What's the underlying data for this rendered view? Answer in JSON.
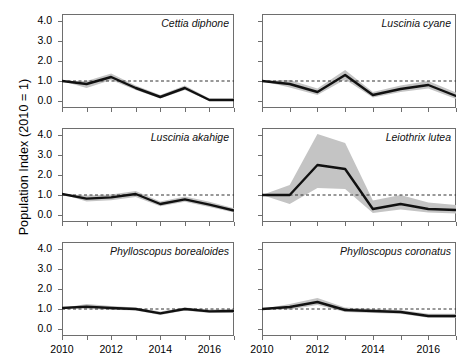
{
  "axes": {
    "ylabel": "Population Index (2010 = 1)",
    "ytick_labels": [
      "4.0",
      "3.0",
      "2.0",
      "1.0",
      "0.0"
    ],
    "ytick_values": [
      4.0,
      3.0,
      2.0,
      1.0,
      0.0
    ],
    "xtick_labels": [
      "2010",
      "2012",
      "2014",
      "2016"
    ],
    "xtick_values": [
      2010,
      2012,
      2014,
      2016
    ],
    "ylim": [
      -0.35,
      4.35
    ],
    "xlim": [
      2010,
      2017
    ],
    "reference_line": 1.0
  },
  "style": {
    "line_color": "#111111",
    "ribbon_color": "#c4c4c4",
    "reference_line_color": "#333333",
    "axis_color": "#6e6e6e",
    "background": "#ffffff"
  },
  "chart_data": [
    {
      "type": "line",
      "title": "Cettia diphone",
      "xlabel": "",
      "ylabel": "Population Index (2010 = 1)",
      "x": [
        2010,
        2011,
        2012,
        2013,
        2014,
        2015,
        2016,
        2017
      ],
      "ylim": [
        -0.35,
        4.35
      ],
      "grid": false,
      "series": [
        {
          "name": "index",
          "values": [
            1.0,
            0.85,
            1.2,
            0.65,
            0.2,
            0.65,
            0.05,
            0.05
          ]
        },
        {
          "name": "ci_lower",
          "values": [
            1.0,
            0.65,
            1.05,
            0.55,
            0.12,
            0.55,
            0.0,
            0.0
          ]
        },
        {
          "name": "ci_upper",
          "values": [
            1.0,
            1.0,
            1.38,
            0.78,
            0.3,
            0.78,
            0.12,
            0.12
          ]
        }
      ]
    },
    {
      "type": "line",
      "title": "Luscinia cyane",
      "xlabel": "",
      "ylabel": "",
      "x": [
        2010,
        2011,
        2012,
        2013,
        2014,
        2015,
        2016,
        2017
      ],
      "ylim": [
        -0.35,
        4.35
      ],
      "grid": false,
      "series": [
        {
          "name": "index",
          "values": [
            1.0,
            0.85,
            0.45,
            1.3,
            0.3,
            0.6,
            0.8,
            0.25
          ]
        },
        {
          "name": "ci_lower",
          "values": [
            1.0,
            0.68,
            0.3,
            1.08,
            0.18,
            0.45,
            0.62,
            0.1
          ]
        },
        {
          "name": "ci_upper",
          "values": [
            1.0,
            1.05,
            0.62,
            1.55,
            0.45,
            0.78,
            1.0,
            0.42
          ]
        }
      ]
    },
    {
      "type": "line",
      "title": "Luscinia akahige",
      "xlabel": "",
      "ylabel": "",
      "x": [
        2010,
        2011,
        2012,
        2013,
        2014,
        2015,
        2016,
        2017
      ],
      "ylim": [
        -0.35,
        4.35
      ],
      "grid": false,
      "series": [
        {
          "name": "index",
          "values": [
            1.05,
            0.82,
            0.88,
            1.05,
            0.55,
            0.78,
            0.52,
            0.22
          ]
        },
        {
          "name": "ci_lower",
          "values": [
            1.05,
            0.68,
            0.74,
            0.9,
            0.44,
            0.66,
            0.4,
            0.12
          ]
        },
        {
          "name": "ci_upper",
          "values": [
            1.05,
            0.97,
            1.03,
            1.2,
            0.68,
            0.92,
            0.66,
            0.34
          ]
        }
      ]
    },
    {
      "type": "line",
      "title": "Leiothrix lutea",
      "xlabel": "",
      "ylabel": "",
      "x": [
        2010,
        2011,
        2012,
        2013,
        2014,
        2015,
        2016,
        2017
      ],
      "ylim": [
        -0.35,
        4.35
      ],
      "grid": false,
      "series": [
        {
          "name": "index",
          "values": [
            1.0,
            1.0,
            2.5,
            2.3,
            0.3,
            0.55,
            0.3,
            0.25
          ]
        },
        {
          "name": "ci_lower",
          "values": [
            1.0,
            0.55,
            1.35,
            1.3,
            0.1,
            0.28,
            0.12,
            0.08
          ]
        },
        {
          "name": "ci_upper",
          "values": [
            1.0,
            1.5,
            4.05,
            3.6,
            0.72,
            1.0,
            0.62,
            0.5
          ]
        }
      ]
    },
    {
      "type": "line",
      "title": "Phylloscopus borealoides",
      "xlabel": "",
      "ylabel": "",
      "x": [
        2010,
        2011,
        2012,
        2013,
        2014,
        2015,
        2016,
        2017
      ],
      "ylim": [
        -0.35,
        4.35
      ],
      "grid": false,
      "series": [
        {
          "name": "index",
          "values": [
            1.05,
            1.12,
            1.05,
            1.0,
            0.78,
            1.0,
            0.88,
            0.9
          ]
        },
        {
          "name": "ci_lower",
          "values": [
            1.05,
            1.0,
            0.96,
            0.93,
            0.7,
            0.92,
            0.8,
            0.8
          ]
        },
        {
          "name": "ci_upper",
          "values": [
            1.05,
            1.25,
            1.15,
            1.08,
            0.87,
            1.08,
            0.97,
            1.0
          ]
        }
      ]
    },
    {
      "type": "line",
      "title": "Phylloscopus coronatus",
      "xlabel": "",
      "ylabel": "",
      "x": [
        2010,
        2011,
        2012,
        2013,
        2014,
        2015,
        2016,
        2017
      ],
      "ylim": [
        -0.35,
        4.35
      ],
      "grid": false,
      "series": [
        {
          "name": "index",
          "values": [
            1.0,
            1.1,
            1.35,
            0.95,
            0.9,
            0.85,
            0.65,
            0.65
          ]
        },
        {
          "name": "ci_lower",
          "values": [
            1.0,
            0.98,
            1.2,
            0.85,
            0.8,
            0.76,
            0.56,
            0.55
          ]
        },
        {
          "name": "ci_upper",
          "values": [
            1.0,
            1.25,
            1.55,
            1.08,
            1.0,
            0.95,
            0.76,
            0.76
          ]
        }
      ]
    }
  ]
}
